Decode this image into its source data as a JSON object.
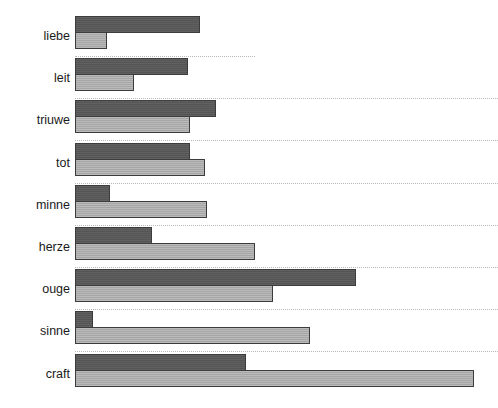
{
  "chart_data": {
    "type": "bar",
    "orientation": "horizontal",
    "title": "",
    "subtitle": "",
    "xlabel": "",
    "ylabel": "",
    "grid": false,
    "separators": true,
    "legend": null,
    "axis_ticks_visible": false,
    "categories": [
      "liebe",
      "leit",
      "triuwe",
      "tot",
      "minne",
      "herze",
      "ouge",
      "sinne",
      "craft"
    ],
    "series": [
      {
        "name": "dark",
        "color": "#595959",
        "values": [
          125,
          113,
          141,
          115,
          35,
          77,
          281,
          18,
          171
        ]
      },
      {
        "name": "light",
        "color": "#adadad",
        "values": [
          32,
          59,
          115,
          130,
          132,
          180,
          198,
          235,
          399
        ]
      }
    ],
    "xlim": [
      0,
      400
    ],
    "units": "relative bar length (pixels)"
  },
  "rows": [
    {
      "label": "liebe",
      "dark": 125,
      "light": 32
    },
    {
      "label": "leit",
      "dark": 113,
      "light": 59
    },
    {
      "label": "triuwe",
      "dark": 141,
      "light": 115
    },
    {
      "label": "tot",
      "dark": 115,
      "light": 130
    },
    {
      "label": "minne",
      "dark": 35,
      "light": 132
    },
    {
      "label": "herze",
      "dark": 77,
      "light": 180
    },
    {
      "label": "ouge",
      "dark": 281,
      "light": 198
    },
    {
      "label": "sinne",
      "dark": 18,
      "light": 235
    },
    {
      "label": "craft",
      "dark": 171,
      "light": 399
    }
  ],
  "layout": {
    "width": 498,
    "height": 408,
    "bar_origin_x": 75,
    "label_right_x": 70,
    "row_pitch": 42.2,
    "first_row_top": 16,
    "bar_height": 17,
    "separator_length": [
      180,
      423,
      423,
      423,
      423,
      423,
      423,
      423,
      423
    ]
  },
  "colors": {
    "background": "#ffffff",
    "dark_bar": "#595959",
    "light_bar": "#adadad",
    "bar_border": "#3c3c3c",
    "separator": "#b9b9b9",
    "label_text": "#1a1a1a"
  }
}
